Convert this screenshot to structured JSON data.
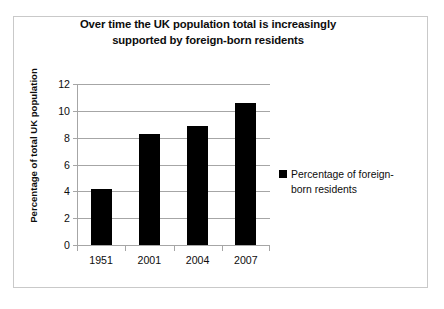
{
  "chart_data": {
    "type": "bar",
    "title": "Over time the UK population total is increasingly supported by foreign-born residents",
    "title_line1": "Over time the UK population total is increasingly",
    "title_line2": "supported by foreign-born residents",
    "categories": [
      "1951",
      "2001",
      "2004",
      "2007"
    ],
    "values": [
      4.2,
      8.3,
      8.9,
      10.6
    ],
    "series": [
      {
        "name": "Percentage of foreign-born residents",
        "values": [
          4.2,
          8.3,
          8.9,
          10.6
        ]
      }
    ],
    "xlabel": "",
    "ylabel": "Percentage of total UK population",
    "ylim": [
      0,
      12
    ],
    "yticks": [
      0,
      2,
      4,
      6,
      8,
      10,
      12
    ],
    "ytick_labels": [
      "0",
      "2",
      "4",
      "6",
      "8",
      "10",
      "12"
    ],
    "grid": true,
    "grid_axis": "y",
    "legend": {
      "position": "right",
      "entries": [
        {
          "label": "Percentage of foreign-born residents",
          "label_line1": "Percentage of foreign-",
          "label_line2": "born residents",
          "color": "#000000",
          "marker": "square"
        }
      ]
    },
    "colors": {
      "bar": "#000000",
      "grid": "#a6a6a6",
      "axis": "#a6a6a6",
      "text": "#0d0d0d",
      "frame": "#c9c9c9",
      "background": "#ffffff"
    }
  }
}
